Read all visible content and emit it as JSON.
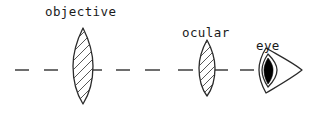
{
  "diagram": {
    "background_color": "#ffffff",
    "ink_color": "#2a2a2a",
    "axis_color": "#4a4a4a",
    "labels": {
      "objective": "objective",
      "ocular": "ocular",
      "eye": "eye"
    },
    "optical_axis": {
      "name": "optical-axis",
      "style": "dashed",
      "y": 70,
      "dashes": [
        {
          "x1": 15,
          "x2": 29
        },
        {
          "x1": 44,
          "x2": 58
        },
        {
          "x1": 92,
          "x2": 102
        },
        {
          "x1": 116,
          "x2": 130
        },
        {
          "x1": 145,
          "x2": 160
        },
        {
          "x1": 178,
          "x2": 193
        },
        {
          "x1": 214,
          "x2": 228
        },
        {
          "x1": 240,
          "x2": 254
        }
      ]
    },
    "elements": [
      {
        "name": "objective-lens",
        "type": "biconvex-lens",
        "label": "objective",
        "center_x": 83,
        "center_y": 66,
        "half_width": 10,
        "half_height": 38,
        "hatched": true,
        "hatch_direction": "lower-left-to-upper-right"
      },
      {
        "name": "ocular-lens",
        "type": "biconvex-lens",
        "label": "ocular",
        "center_x": 207,
        "center_y": 68,
        "half_width": 8,
        "half_height": 28,
        "hatched": true,
        "hatch_direction": "lower-left-to-upper-right"
      },
      {
        "name": "eye",
        "type": "eye",
        "label": "eye",
        "center_x": 272,
        "center_y": 70,
        "pupil_filled": true,
        "pupil_color": "#000000",
        "tail_tip_x": 302
      }
    ],
    "label_positions": {
      "objective": {
        "x": 45,
        "y": 16
      },
      "ocular": {
        "x": 182,
        "y": 37
      },
      "eye": {
        "x": 256,
        "y": 50
      }
    }
  }
}
